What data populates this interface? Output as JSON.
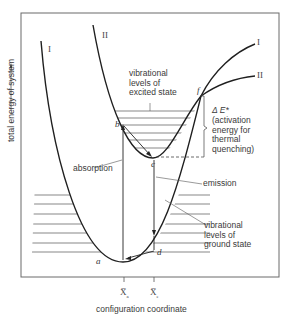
{
  "diagram": {
    "title": "",
    "axes": {
      "y_label": "total energy of system",
      "x_label": "configuration coordinate",
      "x_ticks": [
        {
          "symbol": "X̅",
          "subscript": "a"
        },
        {
          "symbol": "X̅",
          "subscript": "e"
        }
      ]
    },
    "curves": [
      {
        "id": "I",
        "label": "I",
        "label_right": "I",
        "description": "ground state potential energy curve"
      },
      {
        "id": "II",
        "label": "II",
        "label_right": "II",
        "description": "excited state potential energy curve"
      }
    ],
    "points": {
      "a": "a",
      "b": "b",
      "c": "c",
      "d": "d",
      "f": "f"
    },
    "annotations": {
      "excited_levels": "vibrational\nlevels of\nexcited state",
      "ground_levels": "vibrational\nlevels of\nground state",
      "absorption": "absorption",
      "emission": "emission",
      "delta_e": "Δ E*",
      "activation": "(activation\nenergy for\nthermal\nquenching)"
    },
    "colors": {
      "line": "#1f1f1f",
      "frame": "#6a6a6a",
      "text": "#3a3a3a"
    }
  }
}
